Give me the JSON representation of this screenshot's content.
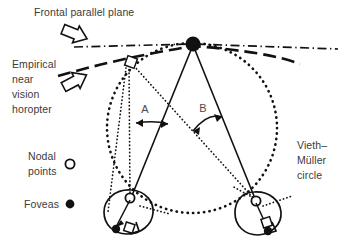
{
  "figure": {
    "type": "diagram",
    "labels": {
      "frontal_plane": "Frontal parallel plane",
      "empirical_horopter_line1": "Empirical",
      "empirical_horopter_line2": "near",
      "empirical_horopter_line3": "vision",
      "empirical_horopter_line4": "horopter",
      "vieth_muller_line1": "Vieth–",
      "vieth_muller_line2": "Müller",
      "vieth_muller_line3": "circle",
      "angle_a": "A",
      "angle_b": "B"
    },
    "legend": {
      "nodal_line1": "Nodal",
      "nodal_line2": "points",
      "nodal_marker": "open-circle-marker",
      "foveas_label": "Foveas",
      "foveas_marker": "filled-circle-marker"
    },
    "colors": {
      "ink": "#111111",
      "text": "#3b3b3b",
      "background": "#ffffff"
    },
    "icons": {
      "fixation_point": "filled-circle-icon",
      "eccentric_target": "open-square-icon",
      "pointer_arrow": "block-arrow-icon"
    }
  }
}
